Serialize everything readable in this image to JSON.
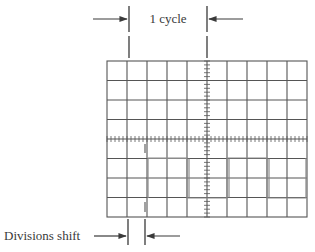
{
  "diagram": {
    "type": "oscilloscope-graticule",
    "colors": {
      "background": "#ffffff",
      "grid": "#555555",
      "trace": "#8a8a8a",
      "annotation": "#3a3a3a"
    },
    "graticule": {
      "columns": 10,
      "rows": 8,
      "minor_ticks_per_division": 5
    },
    "labels": {
      "cycle": "1 cycle",
      "shift": "Divisions shift"
    },
    "waveform": {
      "shape": "square",
      "high_division_row": 5,
      "low_division_row": 7,
      "transitions_at_column": [
        2,
        4,
        6,
        8,
        10
      ],
      "reference_trace_column": 1.9,
      "cycle_span_columns": 5
    }
  }
}
